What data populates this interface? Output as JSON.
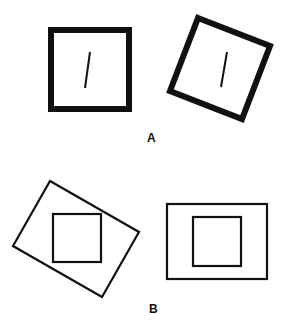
{
  "figure": {
    "panel_a": {
      "label": "A",
      "description": "Thick-framed square with a slightly tilted line inside, upright vs rotated frame"
    },
    "panel_b": {
      "label": "B",
      "description": "Upright inner square inside an upright vs rotated outer rectangle"
    },
    "colors": {
      "ink": "#111111",
      "background": "#ffffff"
    }
  }
}
